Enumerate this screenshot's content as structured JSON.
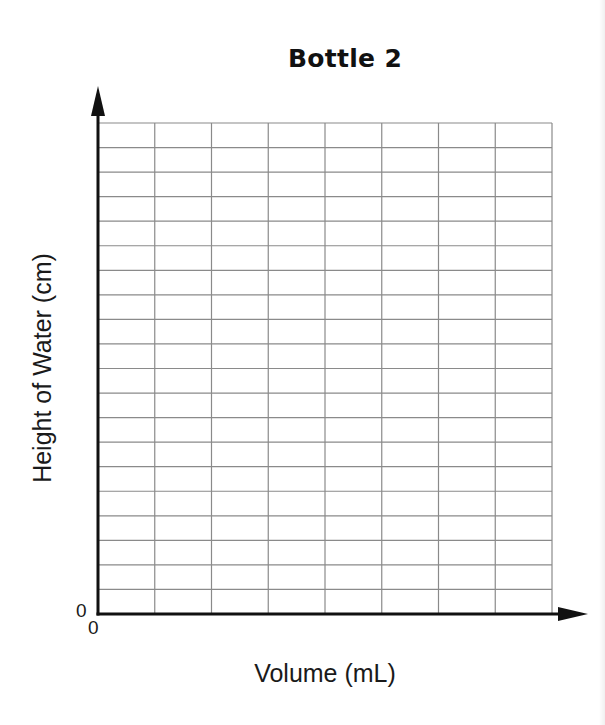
{
  "chart_data": {
    "type": "line",
    "title": "Bottle 2",
    "xlabel": "Volume (mL)",
    "ylabel": "Height of Water (cm)",
    "x_origin_label": "0",
    "y_origin_label": "0",
    "series": [],
    "grid": true,
    "grid_columns": 8,
    "grid_rows": 20,
    "legend": null,
    "note": "Blank grid for student graphing; no data plotted"
  },
  "colors": {
    "axis": "#111111",
    "grid": "#8a8a8a",
    "text": "#1a1a1a",
    "background": "#ffffff"
  }
}
